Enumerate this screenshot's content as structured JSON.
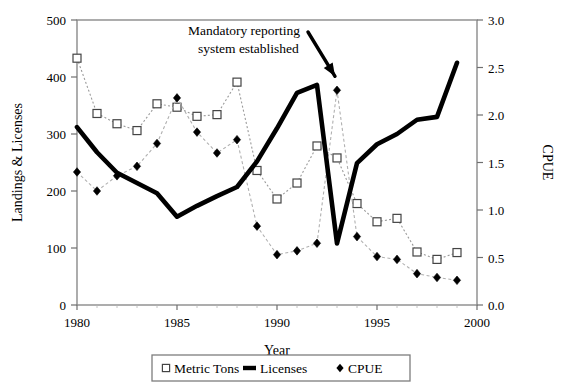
{
  "chart_data": {
    "type": "line",
    "title": "",
    "xlabel": "Year",
    "ylabel": "Landings & Licenses",
    "y2label": "CPUE",
    "x": [
      1980,
      1981,
      1982,
      1983,
      1984,
      1985,
      1986,
      1987,
      1988,
      1989,
      1990,
      1991,
      1992,
      1993,
      1994,
      1995,
      1996,
      1997,
      1998,
      1999
    ],
    "xlim": [
      1980,
      2000
    ],
    "ylim": [
      0,
      500
    ],
    "y2lim": [
      0.0,
      3.0
    ],
    "xticks": [
      1980,
      1985,
      1990,
      1995,
      2000
    ],
    "xtick_labels": [
      "1980",
      "1985",
      "1990",
      "1995",
      "2000"
    ],
    "yticks": [
      0,
      100,
      200,
      300,
      400,
      500
    ],
    "ytick_labels": [
      "0",
      "100",
      "200",
      "300",
      "400",
      "500"
    ],
    "y2ticks": [
      0.0,
      0.5,
      1.0,
      1.5,
      2.0,
      2.5,
      3.0
    ],
    "y2tick_labels": [
      "0.0",
      "0.5",
      "1.0",
      "1.5",
      "2.0",
      "2.5",
      "3.0"
    ],
    "grid": false,
    "legend_position": "below",
    "series": [
      {
        "name": "Metric Tons",
        "axis": "left",
        "marker": "open-square",
        "line": "dotted",
        "values": [
          433,
          336,
          318,
          306,
          353,
          347,
          331,
          334,
          391,
          236,
          186,
          214,
          279,
          258,
          178,
          146,
          152,
          93,
          80,
          92
        ]
      },
      {
        "name": "Licenses",
        "axis": "left",
        "marker": "none",
        "line": "thick-solid",
        "values": [
          312,
          268,
          232,
          214,
          196,
          155,
          174,
          191,
          207,
          252,
          310,
          372,
          386,
          108,
          249,
          282,
          300,
          325,
          330,
          425
        ]
      },
      {
        "name": "CPUE",
        "axis": "right",
        "marker": "filled-diamond",
        "line": "dashed",
        "values": [
          1.4,
          1.2,
          1.36,
          1.46,
          1.7,
          2.18,
          1.82,
          1.6,
          1.74,
          0.83,
          0.53,
          0.57,
          0.65,
          2.26,
          0.72,
          0.51,
          0.48,
          0.33,
          0.29,
          0.26
        ]
      }
    ],
    "annotations": [
      {
        "text_line1": "Mandatory reporting",
        "text_line2": "system established",
        "points_to_year": 1993,
        "arrow": "down-right"
      }
    ]
  },
  "legend": {
    "items": [
      {
        "label": "Metric Tons",
        "marker": "open-square"
      },
      {
        "label": "Licenses",
        "marker": "thick-line"
      },
      {
        "label": "CPUE",
        "marker": "filled-diamond"
      }
    ]
  },
  "colors": {
    "axis": "#6f6f6f",
    "frame": "#8a8a8a",
    "series_licenses": "#000000",
    "series_metric_tons": "#555555",
    "series_cpue": "#000000",
    "background": "#ffffff"
  }
}
